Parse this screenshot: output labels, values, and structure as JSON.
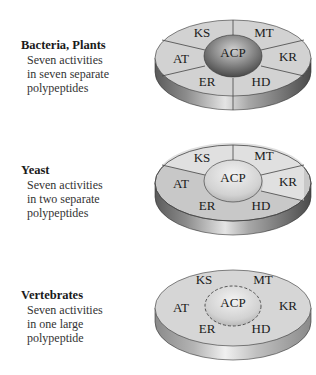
{
  "panels": [
    {
      "title": "Bacteria, Plants",
      "desc": [
        "Seven activities",
        "in seven separate",
        "polypeptides"
      ],
      "domains": {
        "KS": "KS",
        "MT": "MT",
        "AT": "AT",
        "ACP": "ACP",
        "KR": "KR",
        "ER": "ER",
        "HD": "HD"
      }
    },
    {
      "title": "Yeast",
      "desc": [
        "Seven activities",
        "in two separate",
        "polypeptides"
      ],
      "domains": {
        "KS": "KS",
        "MT": "MT",
        "AT": "AT",
        "ACP": "ACP",
        "KR": "KR",
        "ER": "ER",
        "HD": "HD"
      }
    },
    {
      "title": "Vertebrates",
      "desc": [
        "Seven activities",
        "in one large",
        "polypeptide"
      ],
      "domains": {
        "KS": "KS",
        "MT": "MT",
        "AT": "AT",
        "ACP": "ACP",
        "KR": "KR",
        "ER": "ER",
        "HD": "HD"
      }
    }
  ],
  "colors": {
    "top_light": "#d8d8d8",
    "top_mid": "#c4c4c4",
    "side_dark": "#6a6a6a",
    "acp_dark": "#7a7a7a",
    "acp_light": "#dedede"
  }
}
